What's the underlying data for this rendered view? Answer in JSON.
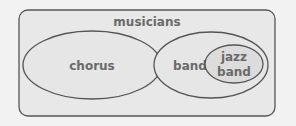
{
  "diagram": {
    "type": "venn-nested-sets",
    "outer": {
      "label": "musicians"
    },
    "sets": [
      {
        "label": "chorus"
      },
      {
        "label": "band",
        "subset": {
          "label_line1": "jazz",
          "label_line2": "band"
        }
      }
    ],
    "colors": {
      "background": "#f2f2f2",
      "fill": "#e6e6e6",
      "inner_fill": "#dcdcdc",
      "stroke": "#555555",
      "text": "#6a6a6a"
    }
  }
}
